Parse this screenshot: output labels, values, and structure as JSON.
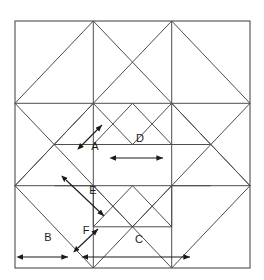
{
  "figure": {
    "background_color": "#ffffff",
    "line_color": "#4d4d4d",
    "arrow_color": "#1a1a1a",
    "label_color": "#1a1a1a",
    "outer_square": {
      "x": 15,
      "y": 21,
      "width": 235,
      "height": 247
    },
    "grid": {
      "columns": 6,
      "rows": 6,
      "cell_width": 39.17,
      "cell_height": 41.17,
      "x_stops": [
        15,
        54.2,
        93.3,
        132.5,
        171.7,
        210.8,
        250
      ],
      "y_stops": [
        21,
        62.2,
        103.3,
        144.5,
        185.7,
        226.8,
        268
      ]
    }
  },
  "labels": [
    {
      "id": "A",
      "text": "A",
      "x": 95,
      "y": 147,
      "measure": "short diagonal",
      "arrow_type": "double-headed-diagonal"
    },
    {
      "id": "B",
      "text": "B",
      "x": 48,
      "y": 238,
      "measure": "corner square width",
      "arrow_type": "double-headed-horizontal"
    },
    {
      "id": "C",
      "text": "C",
      "x": 139,
      "y": 240,
      "measure": "long horizontal span",
      "arrow_type": "double-headed-horizontal"
    },
    {
      "id": "D",
      "text": "D",
      "x": 140,
      "y": 139,
      "measure": "center square width",
      "arrow_type": "double-headed-horizontal"
    },
    {
      "id": "E",
      "text": "E",
      "x": 93,
      "y": 191,
      "measure": "long diagonal",
      "arrow_type": "double-headed-diagonal"
    },
    {
      "id": "F",
      "text": "F",
      "x": 86,
      "y": 231,
      "measure": "short diagonal",
      "arrow_type": "double-headed-diagonal"
    }
  ],
  "arrows": [
    {
      "id": "A",
      "x1": 82,
      "y1": 145,
      "x2": 102,
      "y2": 125
    },
    {
      "id": "B",
      "x1": 23,
      "y1": 257,
      "x2": 68,
      "y2": 257
    },
    {
      "id": "C",
      "x1": 88,
      "y1": 257,
      "x2": 190,
      "y2": 257
    },
    {
      "id": "D",
      "x1": 116,
      "y1": 158,
      "x2": 163,
      "y2": 158
    },
    {
      "id": "E",
      "x1": 66,
      "y1": 180,
      "x2": 104,
      "y2": 216
    },
    {
      "id": "F",
      "x1": 78,
      "y1": 248,
      "x2": 98,
      "y2": 229
    }
  ]
}
